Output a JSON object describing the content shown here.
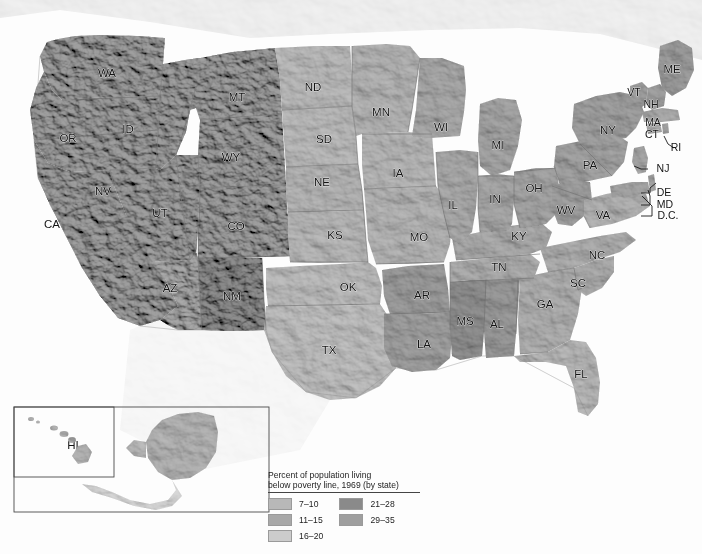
{
  "map": {
    "kind": "choropleth-relief-map",
    "title_absent": true,
    "background_color": "#fdfdfd",
    "border_color": "#6f6f6f",
    "label_color": "#141414"
  },
  "legend": {
    "title_line1": "Percent of population living",
    "title_line2": "below poverty line, 1969 (by state)",
    "columns": [
      {
        "items": [
          {
            "label": "7–10",
            "color": "#b8b8b8"
          },
          {
            "label": "11–15",
            "color": "#a8a8a8"
          },
          {
            "label": "16–20",
            "color": "#cccccc"
          }
        ]
      },
      {
        "items": [
          {
            "label": "21–28",
            "color": "#8a8a8a"
          },
          {
            "label": "29–35",
            "color": "#9e9e9e"
          }
        ]
      }
    ]
  },
  "chart_data": {
    "type": "map",
    "title": "Percent of population living below poverty line, 1969 (by state)",
    "measure": "percent_below_poverty_line",
    "year": 1969,
    "bins": [
      {
        "range": "7-10",
        "min": 7,
        "max": 10,
        "color": "#b8b8b8"
      },
      {
        "range": "11-15",
        "min": 11,
        "max": 15,
        "color": "#a8a8a8"
      },
      {
        "range": "16-20",
        "min": 16,
        "max": 20,
        "color": "#cccccc"
      },
      {
        "range": "21-28",
        "min": 21,
        "max": 28,
        "color": "#8a8a8a"
      },
      {
        "range": "29-35",
        "min": 29,
        "max": 35,
        "color": "#9e9e9e"
      }
    ],
    "states": [
      {
        "code": "WA",
        "bin": "11-15",
        "color": "#a8a8a8",
        "x": 107,
        "y": 74
      },
      {
        "code": "OR",
        "bin": "11-15",
        "color": "#a8a8a8",
        "x": 68,
        "y": 139
      },
      {
        "code": "CA",
        "bin": "11-15",
        "color": "#a8a8a8",
        "x": 52,
        "y": 225
      },
      {
        "code": "ID",
        "bin": "11-15",
        "color": "#a8a8a8",
        "x": 128,
        "y": 130
      },
      {
        "code": "NV",
        "bin": "11-15",
        "color": "#a8a8a8",
        "x": 103,
        "y": 192
      },
      {
        "code": "MT",
        "bin": "11-15",
        "color": "#a8a8a8",
        "x": 237,
        "y": 98
      },
      {
        "code": "WY",
        "bin": "11-15",
        "color": "#a8a8a8",
        "x": 231,
        "y": 158
      },
      {
        "code": "UT",
        "bin": "11-15",
        "color": "#a8a8a8",
        "x": 160,
        "y": 214
      },
      {
        "code": "CO",
        "bin": "11-15",
        "color": "#a8a8a8",
        "x": 236,
        "y": 227
      },
      {
        "code": "AZ",
        "bin": "16-20",
        "color": "#b0b0b0",
        "x": 170,
        "y": 289
      },
      {
        "code": "NM",
        "bin": "29-35",
        "color": "#9a9a9a",
        "x": 232,
        "y": 297
      },
      {
        "code": "ND",
        "bin": "16-20",
        "color": "#c2c2c2",
        "x": 313,
        "y": 88
      },
      {
        "code": "SD",
        "bin": "16-20",
        "color": "#c2c2c2",
        "x": 324,
        "y": 140
      },
      {
        "code": "NE",
        "bin": "11-15",
        "color": "#bdbdbd",
        "x": 322,
        "y": 183
      },
      {
        "code": "KS",
        "bin": "11-15",
        "color": "#c0c0c0",
        "x": 335,
        "y": 236
      },
      {
        "code": "OK",
        "bin": "16-20",
        "color": "#c4c4c4",
        "x": 348,
        "y": 288
      },
      {
        "code": "TX",
        "bin": "16-20",
        "color": "#c6c6c6",
        "x": 329,
        "y": 351
      },
      {
        "code": "MN",
        "bin": "11-15",
        "color": "#bcbcbc",
        "x": 381,
        "y": 113
      },
      {
        "code": "IA",
        "bin": "11-15",
        "color": "#bfbfbf",
        "x": 398,
        "y": 174
      },
      {
        "code": "MO",
        "bin": "16-20",
        "color": "#bdbdbd",
        "x": 419,
        "y": 238
      },
      {
        "code": "AR",
        "bin": "21-28",
        "color": "#a6a6a6",
        "x": 422,
        "y": 296
      },
      {
        "code": "LA",
        "bin": "21-28",
        "color": "#a9a9a9",
        "x": 424,
        "y": 345
      },
      {
        "code": "WI",
        "bin": "11-15",
        "color": "#b2b2b2",
        "x": 441,
        "y": 128
      },
      {
        "code": "IL",
        "bin": "11-15",
        "color": "#b3b3b3",
        "x": 453,
        "y": 206
      },
      {
        "code": "MI",
        "bin": "11-15",
        "color": "#aeaeae",
        "x": 498,
        "y": 146
      },
      {
        "code": "IN",
        "bin": "11-15",
        "color": "#b0b0b0",
        "x": 495,
        "y": 200
      },
      {
        "code": "OH",
        "bin": "11-15",
        "color": "#aeaeae",
        "x": 534,
        "y": 189
      },
      {
        "code": "KY",
        "bin": "21-28",
        "color": "#b4b4b4",
        "x": 519,
        "y": 237
      },
      {
        "code": "TN",
        "bin": "21-28",
        "color": "#b6b6b6",
        "x": 499,
        "y": 268
      },
      {
        "code": "MS",
        "bin": "29-35",
        "color": "#9b9b9b",
        "x": 465,
        "y": 322
      },
      {
        "code": "AL",
        "bin": "21-28",
        "color": "#a4a4a4",
        "x": 497,
        "y": 325
      },
      {
        "code": "GA",
        "bin": "21-28",
        "color": "#b8b8b8",
        "x": 545,
        "y": 305
      },
      {
        "code": "FL",
        "bin": "16-20",
        "color": "#c0c0c0",
        "x": 581,
        "y": 375
      },
      {
        "code": "SC",
        "bin": "21-28",
        "color": "#b5b5b5",
        "x": 578,
        "y": 284
      },
      {
        "code": "NC",
        "bin": "21-28",
        "color": "#b7b7b7",
        "x": 597,
        "y": 256
      },
      {
        "code": "VA",
        "bin": "16-20",
        "color": "#bbbbbb",
        "x": 603,
        "y": 216
      },
      {
        "code": "WV",
        "bin": "21-28",
        "color": "#aaaaaa",
        "x": 566,
        "y": 211
      },
      {
        "code": "PA",
        "bin": "11-15",
        "color": "#acacac",
        "x": 590,
        "y": 166
      },
      {
        "code": "NY",
        "bin": "11-15",
        "color": "#aaaaaa",
        "x": 608,
        "y": 131
      },
      {
        "code": "VT",
        "bin": "11-15",
        "color": "#a9a9a9",
        "x": 634,
        "y": 93
      },
      {
        "code": "NH",
        "bin": "11-15",
        "color": "#a9a9a9",
        "x": 651,
        "y": 105
      },
      {
        "code": "ME",
        "bin": "11-15",
        "color": "#a7a7a7",
        "x": 672,
        "y": 70
      },
      {
        "code": "MA",
        "bin": "7-10",
        "color": "#b4b4b4",
        "x": 653,
        "y": 123
      },
      {
        "code": "CT",
        "bin": "7-10",
        "color": "#b4b4b4",
        "x": 652,
        "y": 135
      },
      {
        "code": "RI",
        "bin": "7-10",
        "color": "#b4b4b4",
        "x": 676,
        "y": 148
      },
      {
        "code": "NJ",
        "bin": "7-10",
        "color": "#b0b0b0",
        "x": 663,
        "y": 169
      },
      {
        "code": "DE",
        "bin": "7-10",
        "color": "#b0b0b0",
        "x": 664,
        "y": 193
      },
      {
        "code": "MD",
        "bin": "11-15",
        "color": "#b0b0b0",
        "x": 665,
        "y": 205
      },
      {
        "code": "D.C.",
        "bin": "16-20",
        "color": "#b0b0b0",
        "x": 668,
        "y": 216
      },
      {
        "code": "AK",
        "bin": "16-20",
        "color": "#bcbcbc",
        "x": 182,
        "y": 452
      },
      {
        "code": "HI",
        "bin": "11-15",
        "color": "#bcbcbc",
        "x": 73,
        "y": 446
      }
    ]
  },
  "inset": {
    "outer_box_label": "alaska-hawaii-inset",
    "hawaii_box_label": "hawaii-inset-box"
  }
}
